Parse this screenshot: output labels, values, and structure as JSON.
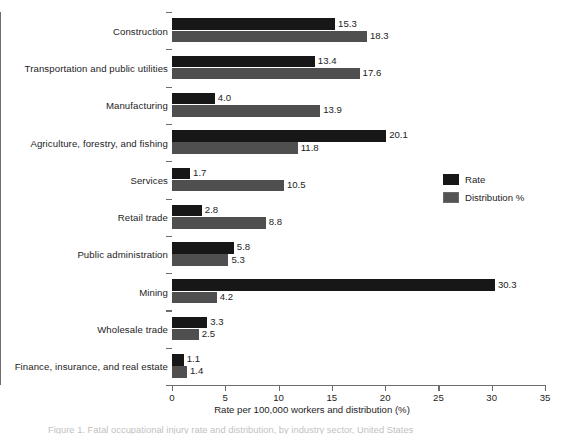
{
  "chart_data": {
    "type": "bar",
    "orientation": "horizontal",
    "title": "",
    "xlabel": "Rate per 100,000 workers and distribution (%)",
    "ylabel": "",
    "xlim": [
      0,
      35
    ],
    "xticks": [
      0,
      5,
      10,
      15,
      20,
      25,
      30,
      35
    ],
    "grid": false,
    "legend_position": "right-middle",
    "categories": [
      "Construction",
      "Transportation and public utilities",
      "Manufacturing",
      "Agriculture, forestry, and fishing",
      "Services",
      "Retail trade",
      "Public administration",
      "Mining",
      "Wholesale trade",
      "Finance, insurance, and real estate"
    ],
    "series": [
      {
        "name": "Rate",
        "color": "#171717",
        "values": [
          15.3,
          13.4,
          4.0,
          20.1,
          1.7,
          2.8,
          5.8,
          30.3,
          3.3,
          1.1
        ],
        "labels": [
          "15.3",
          "13.4",
          "4.0",
          "20.1",
          "1.7",
          "2.8",
          "5.8",
          "30.3",
          "3.3",
          "1.1"
        ]
      },
      {
        "name": "Distribution %",
        "color": "#4f4f4f",
        "values": [
          18.3,
          17.6,
          13.9,
          11.8,
          10.5,
          8.8,
          5.3,
          4.2,
          2.5,
          1.4
        ],
        "labels": [
          "18.3",
          "17.6",
          "13.9",
          "11.8",
          "10.5",
          "8.8",
          "5.3",
          "4.2",
          "2.5",
          "1.4"
        ]
      }
    ]
  },
  "legend": {
    "entries": [
      {
        "label": "Rate",
        "swatch": "black-square-swatch"
      },
      {
        "label": "Distribution %",
        "swatch": "gray-square-swatch"
      }
    ]
  },
  "caption": {
    "text": "Figure 1. Fatal occupational injury rate and distribution, by industry sector, United States"
  }
}
